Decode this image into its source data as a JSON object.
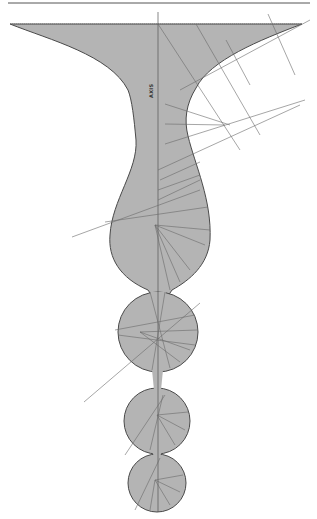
{
  "figure": {
    "title": "",
    "axis_label": "AXIS",
    "colors": {
      "background": "#ffffff",
      "fill": "#b4b4b4",
      "outline": "#4a4a4a",
      "construction_lines": "#6a6a6a",
      "top_rule": "#555555"
    },
    "parts": [
      {
        "name": "funnel",
        "description": "wide funnel section at top narrowing to a neck"
      },
      {
        "name": "bulb",
        "description": "large pear-shaped bulb below neck"
      },
      {
        "name": "drop-1",
        "description": "first circular drop"
      },
      {
        "name": "drop-2",
        "description": "second circular drop"
      },
      {
        "name": "drop-3",
        "description": "third circular drop"
      }
    ]
  }
}
